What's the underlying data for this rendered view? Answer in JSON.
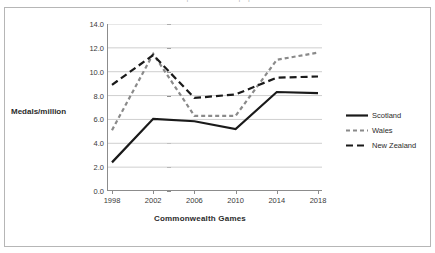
{
  "title_sliver": "Medals per million of population",
  "axis": {
    "y_label": "Medals/million",
    "x_label": "Commonwealth Games",
    "y_ticks": [
      "0.0",
      "2.0",
      "4.0",
      "6.0",
      "8.0",
      "10.0",
      "12.0",
      "14.0"
    ],
    "x_ticks": [
      "1998",
      "2002",
      "2006",
      "2010",
      "2014",
      "2018"
    ]
  },
  "legend": {
    "items": [
      {
        "label": "Scotland",
        "style": "solid",
        "color": "#1a1a1a"
      },
      {
        "label": "Wales",
        "style": "dotted",
        "color": "#8a8a8a"
      },
      {
        "label": "New Zealand",
        "style": "dashed",
        "color": "#1a1a1a"
      }
    ]
  },
  "chart_data": {
    "type": "line",
    "title": "Medals per million of population",
    "xlabel": "Commonwealth Games",
    "ylabel": "Medals/million",
    "categories": [
      "1998",
      "2002",
      "2006",
      "2010",
      "2014",
      "2018"
    ],
    "ylim": [
      0.0,
      14.0
    ],
    "ytick_step": 2.0,
    "grid": true,
    "grid_axis": "y",
    "legend_position": "right",
    "series": [
      {
        "name": "Scotland",
        "color": "#1a1a1a",
        "dash": "none",
        "width": 2.2,
        "values": [
          2.4,
          6.05,
          5.85,
          5.2,
          8.3,
          8.2
        ]
      },
      {
        "name": "Wales",
        "color": "#8a8a8a",
        "dash": "4,3",
        "width": 2.2,
        "values": [
          5.1,
          11.5,
          6.3,
          6.3,
          11.0,
          11.6
        ]
      },
      {
        "name": "New Zealand",
        "color": "#1a1a1a",
        "dash": "7,4",
        "width": 2.2,
        "values": [
          8.9,
          11.4,
          7.8,
          8.1,
          9.5,
          9.6
        ]
      }
    ]
  }
}
